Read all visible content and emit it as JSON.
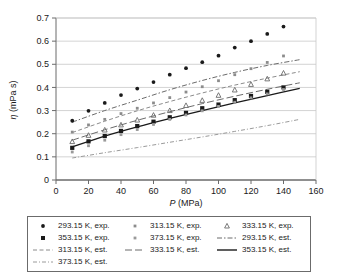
{
  "chart_data": {
    "type": "scatter",
    "title": "",
    "xlabel": "P (MPa)",
    "ylabel": "η (mPa s)",
    "xlim": [
      0,
      160
    ],
    "ylim": [
      0,
      0.7
    ],
    "xticks": [
      0,
      20,
      40,
      60,
      80,
      100,
      120,
      140,
      160
    ],
    "yticks": [
      0,
      0.1,
      0.2,
      0.3,
      0.4,
      0.5,
      0.6,
      0.7
    ],
    "xtick_labels": [
      "0",
      "20",
      "40",
      "60",
      "80",
      "100",
      "120",
      "140",
      "160"
    ],
    "ytick_labels": [
      "0",
      "0.1",
      "0.2",
      "0.3",
      "0.4",
      "0.5",
      "0.6",
      "0.7"
    ],
    "grid": "horizontal",
    "legend_position": "below-plot",
    "series": [
      {
        "name": "293.15 K, exp.",
        "kind": "experimental",
        "marker": "filled-circle",
        "color": "#1a1a1a",
        "x": [
          10,
          20,
          30,
          40,
          50,
          60,
          70,
          80,
          90,
          100,
          110,
          120,
          130,
          140
        ],
        "y": [
          0.256,
          0.299,
          0.333,
          0.367,
          0.395,
          0.423,
          0.455,
          0.483,
          0.509,
          0.537,
          0.572,
          0.6,
          0.631,
          0.663
        ]
      },
      {
        "name": "313.15 K, exp.",
        "kind": "experimental",
        "marker": "small-dot",
        "color": "#8c8c8c",
        "x": [
          10,
          20,
          30,
          40,
          50,
          60,
          70,
          80,
          90,
          100,
          110,
          120,
          130,
          140
        ],
        "y": [
          0.207,
          0.238,
          0.262,
          0.287,
          0.31,
          0.333,
          0.356,
          0.38,
          0.403,
          0.429,
          0.455,
          0.481,
          0.508,
          0.536
        ]
      },
      {
        "name": "333.15 K, exp.",
        "kind": "experimental",
        "marker": "triangle",
        "color": "#6b6b6b",
        "x": [
          10,
          20,
          30,
          40,
          50,
          60,
          70,
          80,
          90,
          100,
          110,
          120,
          130,
          140
        ],
        "y": [
          0.166,
          0.193,
          0.216,
          0.238,
          0.259,
          0.28,
          0.3,
          0.322,
          0.344,
          0.366,
          0.389,
          0.413,
          0.437,
          0.462
        ]
      },
      {
        "name": "353.15 K, exp.",
        "kind": "experimental",
        "marker": "filled-square",
        "color": "#1a1a1a",
        "x": [
          10,
          20,
          30,
          40,
          50,
          60,
          70,
          80,
          90,
          100,
          110,
          120,
          130,
          140
        ],
        "y": [
          0.139,
          0.167,
          0.19,
          0.212,
          0.233,
          0.252,
          0.271,
          0.29,
          0.31,
          0.326,
          0.345,
          0.363,
          0.381,
          0.4
        ]
      },
      {
        "name": "373.15 K, exp.",
        "kind": "experimental",
        "marker": "small-dot",
        "color": "#9a9a9a",
        "x": [
          10,
          20,
          30,
          40,
          50,
          60,
          70,
          80,
          90,
          100,
          110,
          120,
          130,
          140
        ],
        "y": [
          0.121,
          0.148,
          0.172,
          0.196,
          0.218,
          0.24,
          0.262,
          0.281,
          0.299,
          0.318,
          0.336,
          0.355,
          0.372,
          0.391
        ]
      },
      {
        "name": "293.15 K, est.",
        "kind": "estimated",
        "line": "dash-dot",
        "color": "#6b6b6b",
        "x": [
          10,
          30,
          50,
          70,
          90,
          110,
          130,
          150
        ],
        "y": [
          0.25,
          0.3,
          0.345,
          0.39,
          0.43,
          0.465,
          0.495,
          0.52
        ]
      },
      {
        "name": "313.15 K, est.",
        "kind": "estimated",
        "line": "dashed",
        "color": "#8c8c8c",
        "x": [
          10,
          30,
          50,
          70,
          90,
          110,
          130,
          150
        ],
        "y": [
          0.205,
          0.254,
          0.299,
          0.339,
          0.376,
          0.41,
          0.44,
          0.468
        ]
      },
      {
        "name": "333.15 K, est.",
        "kind": "estimated",
        "line": "long-dash",
        "color": "#6b6b6b",
        "x": [
          10,
          30,
          50,
          70,
          90,
          110,
          130,
          150
        ],
        "y": [
          0.172,
          0.217,
          0.258,
          0.295,
          0.33,
          0.362,
          0.392,
          0.42
        ]
      },
      {
        "name": "353.15 K, est.",
        "kind": "estimated",
        "line": "solid",
        "color": "#1a1a1a",
        "x": [
          10,
          30,
          50,
          70,
          90,
          110,
          130,
          150
        ],
        "y": [
          0.143,
          0.19,
          0.23,
          0.266,
          0.3,
          0.333,
          0.365,
          0.396
        ]
      },
      {
        "name": "373.15 K, est.",
        "kind": "estimated",
        "line": "dash-dot-fine",
        "color": "#9a9a9a",
        "x": [
          10,
          30,
          50,
          70,
          90,
          110,
          130,
          150
        ],
        "y": [
          0.095,
          0.118,
          0.14,
          0.163,
          0.186,
          0.21,
          0.235,
          0.262
        ]
      }
    ]
  },
  "legend": {
    "entries": [
      {
        "label": "293.15 K, exp.",
        "key": "filled-circle"
      },
      {
        "label": "313.15 K, exp.",
        "key": "small-dot"
      },
      {
        "label": "333.15 K, exp.",
        "key": "triangle"
      },
      {
        "label": "353.15 K, exp.",
        "key": "filled-square"
      },
      {
        "label": "373.15 K, exp.",
        "key": "small-dot-2"
      },
      {
        "label": "293.15 K, est.",
        "key": "dash-dot"
      },
      {
        "label": "313.15 K, est.",
        "key": "dashed"
      },
      {
        "label": "333.15 K, est.",
        "key": "long-dash"
      },
      {
        "label": "353.15 K, est.",
        "key": "solid"
      },
      {
        "label": "373.15 K, est.",
        "key": "dash-dot-fine"
      }
    ]
  },
  "axes": {
    "x_label": "P (MPa)",
    "x_label_italic": "P",
    "x_label_unit": " (MPa)",
    "y_label": "η (mPa s)",
    "y_label_italic": "η",
    "y_label_unit": " (mPa s)"
  },
  "colors": {
    "frame": "#6b6b6b",
    "grid": "#c8c8c8",
    "text": "#1a1a1a",
    "background": "#ffffff"
  }
}
